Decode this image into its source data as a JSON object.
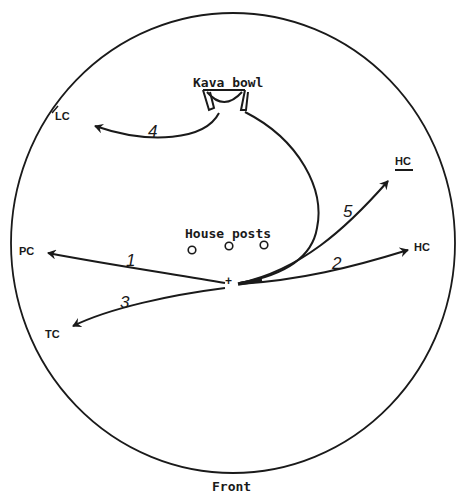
{
  "diagram": {
    "type": "seating/ritual layout (circular floor plan)",
    "labels": {
      "kava_bowl": "Kava bowl",
      "house_posts": "House posts",
      "front": "Front",
      "center_marker": "+",
      "lc": "LC",
      "pc": "PC",
      "tc": "TC",
      "hc_upper": "HC",
      "hc_right": "HC"
    },
    "arrows": [
      {
        "number": "1",
        "from": "center",
        "to": "PC"
      },
      {
        "number": "2",
        "from": "center",
        "to": "HC"
      },
      {
        "number": "3",
        "from": "center",
        "to": "TC"
      },
      {
        "number": "4",
        "from": "Kava bowl",
        "to": "LC"
      },
      {
        "number": "5",
        "from": "center",
        "to": "HC (underlined)"
      }
    ],
    "house_post_count": 3,
    "stroke_color": "#1a1a1a",
    "background_color": "#ffffff"
  }
}
